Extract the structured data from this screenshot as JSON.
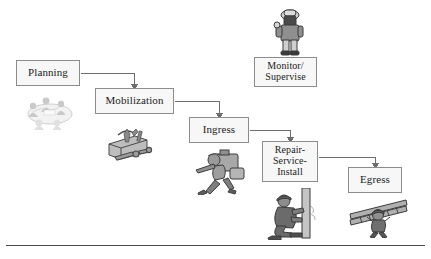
{
  "figure": {
    "type": "process-flow-diagram",
    "title": "",
    "background_color": "#ffffff",
    "box_fill": "#f7f7f7",
    "box_border": "#8c8c8c",
    "connector_color": "#6e6e6e",
    "rule_color": "#4a4a4a"
  },
  "nodes": [
    {
      "id": "planning",
      "label": "Planning",
      "lines": [
        "Planning"
      ],
      "x": 16,
      "y": 60,
      "w": 64,
      "h": 26,
      "font_size": 11
    },
    {
      "id": "mobilization",
      "label": "Mobilization",
      "lines": [
        "Mobilization"
      ],
      "x": 95,
      "y": 88,
      "w": 79,
      "h": 26,
      "font_size": 11
    },
    {
      "id": "ingress",
      "label": "Ingress",
      "lines": [
        "Ingress"
      ],
      "x": 189,
      "y": 117,
      "w": 60,
      "h": 26,
      "font_size": 11
    },
    {
      "id": "repair-service-install",
      "label": "Repair-Service-Install",
      "lines": [
        "Repair-",
        "Service-",
        "Install"
      ],
      "x": 262,
      "y": 141,
      "w": 56,
      "h": 41,
      "font_size": 10
    },
    {
      "id": "egress",
      "label": "Egress",
      "lines": [
        "Egress"
      ],
      "x": 348,
      "y": 167,
      "w": 54,
      "h": 26,
      "font_size": 11
    },
    {
      "id": "monitor-supervise",
      "label": "Monitor/ Supervise",
      "lines": [
        "Monitor/",
        "Supervise"
      ],
      "x": 254,
      "y": 57,
      "w": 63,
      "h": 30,
      "font_size": 10
    }
  ],
  "connectors": [
    {
      "id": "planning-to-mobilization",
      "from": "planning",
      "to": "mobilization"
    },
    {
      "id": "mobilization-to-ingress",
      "from": "mobilization",
      "to": "ingress"
    },
    {
      "id": "ingress-to-repair",
      "from": "ingress",
      "to": "repair-service-install"
    },
    {
      "id": "repair-to-egress",
      "from": "repair-service-install",
      "to": "egress"
    }
  ],
  "illustrations": [
    {
      "id": "planning-meeting-art",
      "name": "planning-meeting-illustration",
      "for": "planning",
      "x": 22,
      "y": 92,
      "w": 53,
      "h": 38
    },
    {
      "id": "toolbox-art",
      "name": "toolbox-illustration",
      "for": "mobilization",
      "x": 105,
      "y": 124,
      "w": 55,
      "h": 40
    },
    {
      "id": "worker-carrying-equipment-art",
      "name": "worker-carrying-equipment-illustration",
      "for": "ingress",
      "x": 190,
      "y": 148,
      "w": 58,
      "h": 47
    },
    {
      "id": "worker-at-pole-art",
      "name": "worker-repairing-pole-illustration",
      "for": "repair-service-install",
      "x": 262,
      "y": 188,
      "w": 59,
      "h": 52
    },
    {
      "id": "worker-with-ladder-art",
      "name": "worker-carrying-ladder-illustration",
      "for": "egress",
      "x": 348,
      "y": 194,
      "w": 62,
      "h": 44
    },
    {
      "id": "supervisor-art",
      "name": "supervisor-figure-illustration",
      "for": "monitor-supervise",
      "x": 272,
      "y": 8,
      "w": 34,
      "h": 48
    }
  ],
  "rule": {
    "id": "bottom-rule",
    "y": 245
  }
}
